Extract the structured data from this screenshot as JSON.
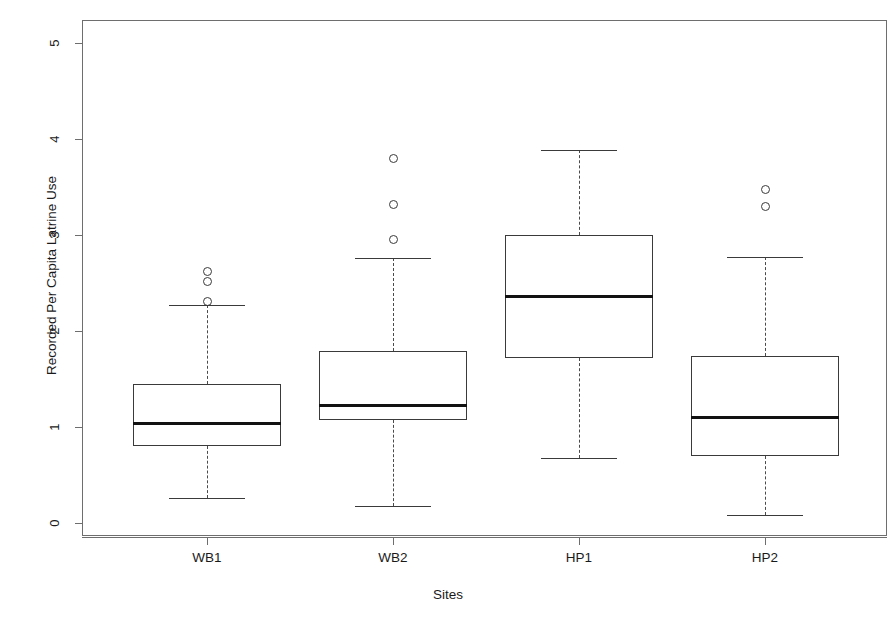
{
  "chart_data": {
    "type": "box",
    "title": "",
    "xlabel": "Sites",
    "ylabel": "Recorded Per Capita Latrine Use",
    "ylim": [
      0,
      5.25
    ],
    "yticks": [
      0,
      1,
      2,
      3,
      4,
      5
    ],
    "ytick_labels": [
      "0",
      "1",
      "2",
      "3",
      "4",
      "5"
    ],
    "categories": [
      "WB1",
      "WB2",
      "HP1",
      "HP2"
    ],
    "grid": false,
    "legend": "none",
    "boxes": [
      {
        "name": "WB1",
        "whisker_low": 0.26,
        "q1": 0.8,
        "median": 1.04,
        "q3": 1.45,
        "whisker_high": 2.27,
        "outliers": [
          2.31,
          2.52,
          2.62
        ]
      },
      {
        "name": "WB2",
        "whisker_low": 0.18,
        "q1": 1.07,
        "median": 1.23,
        "q3": 1.79,
        "whisker_high": 2.76,
        "outliers": [
          2.95,
          3.32,
          3.8
        ]
      },
      {
        "name": "HP1",
        "whisker_low": 0.68,
        "q1": 1.72,
        "median": 2.36,
        "q3": 3.0,
        "whisker_high": 3.89,
        "outliers": []
      },
      {
        "name": "HP2",
        "whisker_low": 0.08,
        "q1": 0.7,
        "median": 1.1,
        "q3": 1.74,
        "whisker_high": 2.77,
        "outliers": [
          3.3,
          3.47
        ]
      }
    ]
  },
  "colors": {
    "frame": "#6e6e6e",
    "box_border": "#3a3a3a",
    "median": "#111111",
    "whisker": "#4a4a4a",
    "background": "#ffffff"
  }
}
